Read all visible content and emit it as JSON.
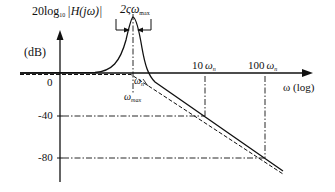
{
  "diagram": {
    "type": "bode-magnitude-plot",
    "y_axis": {
      "label_prefix": "20log",
      "label_sub": "10",
      "label_expr": "|H(jω)|",
      "unit": "(dB)",
      "ticks": [
        "0",
        "-40",
        "-80"
      ]
    },
    "x_axis": {
      "label": "ω (log)",
      "ticks": [
        {
          "coef": "10",
          "sym": "ω",
          "sub": "n"
        },
        {
          "coef": "100",
          "sym": "ω",
          "sub": "n"
        }
      ]
    },
    "annotations": {
      "bandwidth_prefix": "2ς",
      "bandwidth_sym": "ω",
      "bandwidth_sub": "max",
      "omega_n_sym": "ω",
      "omega_n_sub": "n",
      "omega_max_sym": "ω",
      "omega_max_sub": "max"
    },
    "curves": [
      {
        "name": "actual-response",
        "style": "solid",
        "description": "resonant peak near ω_n then -40 dB/decade rolloff"
      },
      {
        "name": "asymptote",
        "style": "dashed",
        "description": "0 dB up to ω_n then -40 dB/decade"
      }
    ]
  }
}
